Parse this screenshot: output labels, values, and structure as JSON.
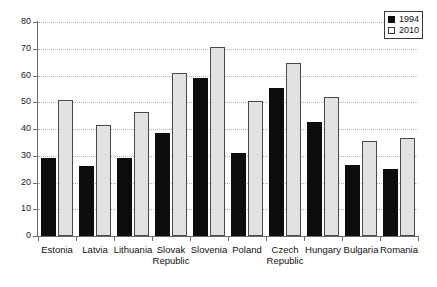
{
  "chart_data": {
    "type": "bar",
    "title": "",
    "subtitle": "",
    "xlabel": "",
    "ylabel": "",
    "ylim": [
      0,
      80
    ],
    "yticks": [
      0,
      10,
      20,
      30,
      40,
      50,
      60,
      70,
      80
    ],
    "grid": "horizontal-dotted",
    "legend_position": "top-right",
    "categories": [
      "Estonia",
      "Latvia",
      "Lithuania",
      "Slovak Republic",
      "Slovenia",
      "Poland",
      "Czech Republic",
      "Hungary",
      "Bulgaria",
      "Romania"
    ],
    "category_lines": [
      [
        "Estonia",
        ""
      ],
      [
        "Latvia",
        ""
      ],
      [
        "Lithuania",
        ""
      ],
      [
        "Slovak",
        "Republic"
      ],
      [
        "Slovenia",
        ""
      ],
      [
        "Poland",
        ""
      ],
      [
        "Czech",
        "Republic"
      ],
      [
        "Hungary",
        ""
      ],
      [
        "Bulgaria",
        ""
      ],
      [
        "Romania",
        ""
      ]
    ],
    "series": [
      {
        "name": "1994",
        "color": "#0d0d0d",
        "values": [
          29,
          26,
          29,
          38.5,
          59,
          31,
          55.5,
          42.5,
          26.5,
          25
        ]
      },
      {
        "name": "2010",
        "color": "#e2e2e2",
        "values": [
          51,
          41.5,
          46.5,
          61,
          70.5,
          50.5,
          64.5,
          52,
          35.5,
          36.5
        ]
      }
    ]
  },
  "legend": {
    "entries": [
      {
        "label": "1994",
        "style": "filled"
      },
      {
        "label": "2010",
        "style": "hollow"
      }
    ]
  }
}
